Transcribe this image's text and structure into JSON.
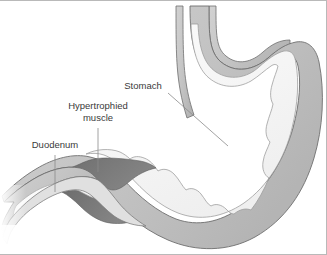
{
  "figure": {
    "background_color": "#ffffff",
    "frame_color": "#b9b9b9",
    "width": 327,
    "height": 255
  },
  "labels": {
    "stomach": {
      "text": "Stomach",
      "x": 143,
      "y": 89,
      "leader_from": [
        168,
        93
      ],
      "leader_to": [
        228,
        146
      ]
    },
    "hypertrophied_muscle": {
      "line1": "Hypertrophied",
      "line2": "muscle",
      "x": 98,
      "y": 109,
      "line2_y": 121,
      "leader_from": [
        98,
        128
      ],
      "leader_to": [
        98,
        172
      ]
    },
    "duodenum": {
      "text": "Duodenum",
      "x": 55,
      "y": 148,
      "leader_from": [
        55,
        155
      ],
      "leader_to": [
        55,
        192
      ]
    }
  },
  "anatomy": {
    "stomach_lumen_fill": "#f7f7f7",
    "mucosa_fill": "#e9e9e9",
    "muscle_wall_fill": "#c6c6c6",
    "serosa_outline": "#6e6e6e",
    "hypertrophied_muscle_fill": "#7a7a7a",
    "hypertrophied_muscle_dark": "#6b6b6b",
    "esophagus_wall_fill": "#cfcfcf",
    "duodenum_lumen_fill": "#fbfbfb",
    "parts": [
      "esophagus",
      "fundus",
      "body",
      "antrum",
      "pylorus",
      "duodenum",
      "hypertrophied-pyloric-muscle"
    ]
  }
}
